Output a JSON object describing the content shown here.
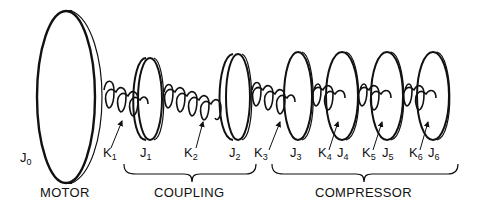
{
  "diagram": {
    "type": "torsional-mass-spring-system",
    "components": {
      "motor_inertia": {
        "symbol": "J",
        "sub": "0"
      },
      "inertias": [
        {
          "symbol": "J",
          "sub": "1"
        },
        {
          "symbol": "J",
          "sub": "2"
        },
        {
          "symbol": "J",
          "sub": "3"
        },
        {
          "symbol": "J",
          "sub": "4"
        },
        {
          "symbol": "J",
          "sub": "5"
        },
        {
          "symbol": "J",
          "sub": "6"
        }
      ],
      "springs": [
        {
          "symbol": "K",
          "sub": "1"
        },
        {
          "symbol": "K",
          "sub": "2"
        },
        {
          "symbol": "K",
          "sub": "3"
        },
        {
          "symbol": "K",
          "sub": "4"
        },
        {
          "symbol": "K",
          "sub": "5"
        },
        {
          "symbol": "K",
          "sub": "6"
        }
      ]
    },
    "groups": {
      "motor": "MOTOR",
      "coupling": "COUPLING",
      "compressor": "COMPRESSOR"
    },
    "colors": {
      "ink": "#111111",
      "background": "#ffffff"
    }
  }
}
